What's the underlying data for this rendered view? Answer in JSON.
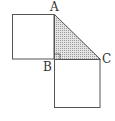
{
  "diagram": {
    "labels": {
      "A": "A",
      "B": "B",
      "C": "C"
    },
    "points": {
      "A": [
        54,
        14
      ],
      "B": [
        54,
        59
      ],
      "C": [
        100,
        59
      ]
    },
    "colors": {
      "stroke": "#555555",
      "shade": "#d8d8d8"
    },
    "shapes": [
      "square-on-AB",
      "square-on-BC",
      "right-triangle-ABC-shaded",
      "right-angle-mark-at-B"
    ]
  }
}
